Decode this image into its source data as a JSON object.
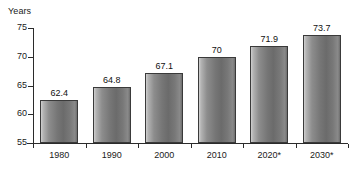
{
  "chart_data": {
    "type": "bar",
    "title": "",
    "subtitle": "",
    "xlabel": "",
    "ylabel": "Years",
    "categories": [
      "1980",
      "1990",
      "2000",
      "2010",
      "2020*",
      "2030*"
    ],
    "values": [
      62.4,
      64.8,
      67.1,
      70,
      73.7,
      71.9
    ],
    "data_labels": [
      "62.4",
      "64.8",
      "67.1",
      "70",
      "71.9",
      "73.7"
    ],
    "series": [
      {
        "name": "Years",
        "values": [
          62.4,
          64.8,
          67.1,
          70,
          71.9,
          73.7
        ]
      }
    ],
    "ylim": [
      55,
      75
    ],
    "y_ticks": [
      75,
      70,
      65,
      60,
      55
    ],
    "y_tick_labels": [
      "75",
      "70",
      "65",
      "60",
      "55"
    ],
    "grid": false,
    "legend": false,
    "legend_position": "none",
    "annotations": [],
    "colors": {
      "bar_light": "#cfcfcf",
      "bar_mid": "#8d8d8d",
      "bar_dark": "#6b6b6b",
      "bar_outline": "#3a3a3a",
      "axis": "#2b2b2b",
      "text": "#1a1a1a",
      "background": "#ffffff"
    }
  }
}
